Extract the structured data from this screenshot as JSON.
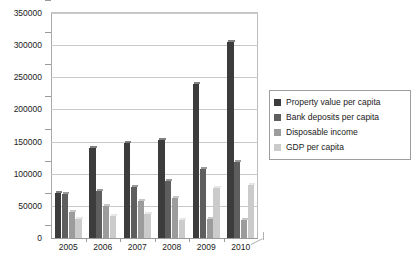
{
  "chart_data": {
    "type": "bar",
    "title": "",
    "subtitle": "",
    "xlabel": "",
    "ylabel": "",
    "categories": [
      "2005",
      "2006",
      "2007",
      "2008",
      "2009",
      "2010"
    ],
    "ylim": [
      0,
      350000
    ],
    "ytick_labels": [
      "0",
      "50000",
      "100000",
      "150000",
      "200000",
      "250000",
      "300000",
      "350000"
    ],
    "ytick_values": [
      0,
      50000,
      100000,
      150000,
      200000,
      250000,
      300000,
      350000
    ],
    "grid": true,
    "legend_position": "right",
    "series": [
      {
        "name": "Property value per capita",
        "color": "#3c3c3c",
        "values": [
          70000,
          140000,
          148000,
          152000,
          240000,
          305000
        ]
      },
      {
        "name": "Bank deposits per capita",
        "color": "#5e5e5e",
        "values": [
          68000,
          73000,
          80000,
          88000,
          108000,
          118000
        ]
      },
      {
        "name": "Disposable income",
        "color": "#9c9c9c",
        "values": [
          40000,
          50000,
          57000,
          62000,
          30000,
          28000
        ]
      },
      {
        "name": "GDP per capita",
        "color": "#cbcbcb",
        "values": [
          30000,
          34000,
          37000,
          28000,
          78000,
          83000
        ]
      }
    ]
  },
  "legend": {
    "items": [
      {
        "label": "Property value per capita",
        "swatch": "#3c3c3c"
      },
      {
        "label": "Bank deposits per capita",
        "swatch": "#5e5e5e"
      },
      {
        "label": "Disposable income",
        "swatch": "#9c9c9c"
      },
      {
        "label": "GDP per capita",
        "swatch": "#cbcbcb"
      }
    ]
  }
}
